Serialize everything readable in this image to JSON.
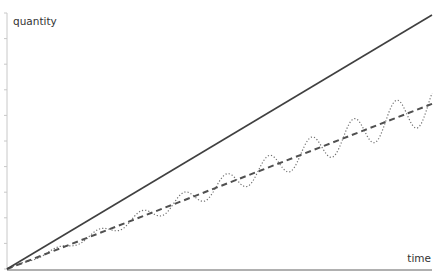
{
  "chart_data": {
    "type": "line",
    "title": "",
    "xlabel": "time",
    "ylabel": "quantity",
    "grid": false,
    "legend": null,
    "xlim": [
      0,
      1
    ],
    "ylim": [
      0,
      1
    ],
    "series": [
      {
        "name": "linear-steep",
        "style": "solid",
        "color": "#404040",
        "description": "straight line from origin rising to top-right",
        "x": [
          0,
          1
        ],
        "values": [
          0,
          1
        ]
      },
      {
        "name": "linear-trend",
        "style": "dashed",
        "color": "#505050",
        "description": "straight line from origin with lower slope",
        "x": [
          0,
          1
        ],
        "values": [
          0,
          0.65
        ]
      },
      {
        "name": "oscillating",
        "style": "dotted",
        "color": "#707070",
        "description": "sinusoidal oscillation around the dashed trend with amplitude growing over time",
        "trend_slope": 0.65,
        "amplitude_at_end": 0.075,
        "periods": 10
      }
    ]
  },
  "plot": {
    "origin": [
      7,
      269
    ],
    "x_end": 432,
    "y_top": 13,
    "ytick_count": 10
  },
  "axis_color": "#c8c8c8",
  "xaxis_color": "#b0b0b0"
}
